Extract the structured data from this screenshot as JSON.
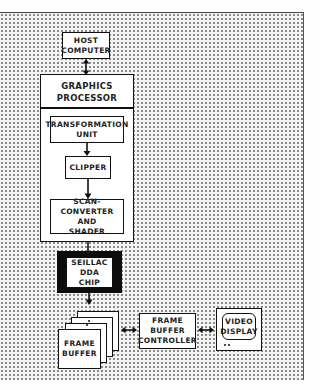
{
  "diagram": {
    "nodes": {
      "host_computer": {
        "label": "HOST\nCOMPUTER"
      },
      "graphics_processor": {
        "label": "GRAPHICS\nPROCESSOR",
        "stages": [
          {
            "label": "TRANSFORMATION\nUNIT"
          },
          {
            "label": "CLIPPER"
          },
          {
            "label": "SCAN-CONVERTER\nAND\nSHADER"
          }
        ]
      },
      "seillac_chip": {
        "label": "SEILLAC\nDDA\nCHIP"
      },
      "frame_buffer": {
        "label": "FRAME\nBUFFER",
        "stack_count": 4
      },
      "frame_buffer_controller": {
        "label": "FRAME\nBUFFER\nCONTROLLER"
      },
      "video_display": {
        "label": "VIDEO\nDISPLAY"
      }
    },
    "edges": [
      {
        "from": "host_computer",
        "to": "graphics_processor",
        "type": "bidirectional"
      },
      {
        "from": "transformation_unit",
        "to": "clipper",
        "type": "directed"
      },
      {
        "from": "clipper",
        "to": "scan_converter_and_shader",
        "type": "directed"
      },
      {
        "from": "graphics_processor",
        "to": "seillac_chip",
        "type": "directed"
      },
      {
        "from": "seillac_chip",
        "to": "frame_buffer",
        "type": "directed"
      },
      {
        "from": "frame_buffer",
        "to": "frame_buffer_controller",
        "type": "bidirectional"
      },
      {
        "from": "frame_buffer_controller",
        "to": "video_display",
        "type": "bidirectional"
      }
    ],
    "colors": {
      "line": "#111111",
      "box_fill": "#ffffff",
      "chip_fill": "#0c0c0c",
      "background_dots": "#8a8a8a"
    }
  }
}
